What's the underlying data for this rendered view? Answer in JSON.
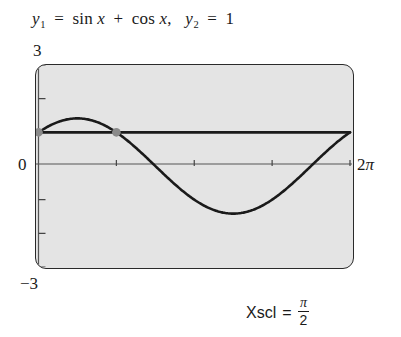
{
  "title": {
    "y1_name": "y",
    "y1_sub": "1",
    "equals": "=",
    "sin": "sin",
    "x1": "x",
    "plus": "+",
    "cos": "cos",
    "x2": "x",
    "comma": ",",
    "y2_name": "y",
    "y2_sub": "2",
    "equals2": "=",
    "y2_value": "1",
    "full_text": "y1 = sin x + cos x,  y2 = 1"
  },
  "axis_labels": {
    "y_max": "3",
    "y_min": "−3",
    "origin": "0",
    "x_max": "2π",
    "x_max_number": "2",
    "x_max_pi": "π"
  },
  "caption": {
    "label": "Xscl",
    "equals": "=",
    "numerator": "π",
    "denominator": "2",
    "full_text": "Xscl = π/2"
  },
  "colors": {
    "screen_fill": "#e4e4e4",
    "screen_border": "#2a2a2a",
    "curve": "#1a1a1a",
    "line": "#1a1a1a",
    "axis": "#555555",
    "tick": "#444444",
    "intersection_dot": "#8a8a8a",
    "text": "#1a1a1a"
  },
  "chart_data": {
    "type": "line",
    "title": "y1 = sin x + cos x,  y2 = 1",
    "xlabel": "",
    "ylabel": "",
    "xlim": [
      0,
      6.283185307179586
    ],
    "ylim": [
      -3,
      3
    ],
    "xlim_label": [
      "0",
      "2π"
    ],
    "ylim_label": [
      "−3",
      "3"
    ],
    "grid": false,
    "legend": "none",
    "xscl": 1.5707963267948966,
    "xscl_label": "π/2",
    "yscl": 1,
    "x_ticks": [
      1.5707963267948966,
      3.141592653589793,
      4.71238898038469,
      6.283185307179586
    ],
    "x_tick_labels": [
      "π/2",
      "π",
      "3π/2",
      "2π"
    ],
    "y_ticks": [
      -3,
      -2,
      -1,
      0,
      1,
      2,
      3
    ],
    "series": [
      {
        "name": "y1 = sin x + cos x",
        "expression": "sin(x) + cos(x)",
        "amplitude": 1.4142135623730951,
        "x": [
          0,
          0.3141592653589793,
          0.6283185307179586,
          0.7853981633974483,
          0.9424777960769379,
          1.2566370614359172,
          1.5707963267948966,
          1.8849555921538759,
          2.199114857512855,
          2.5132741228718345,
          2.827433388230814,
          3.141592653589793,
          3.4557519189487724,
          3.7699111843077517,
          4.084070449666731,
          3.9269908169872414,
          4.39822971502571,
          4.71238898038469,
          5.026548245743669,
          5.497787143782138,
          5.654866776461628,
          5.969026041820607,
          6.283185307179586
        ],
        "y": [
          1.0,
          1.258,
          1.397,
          1.41421,
          1.397,
          1.258,
          1.0,
          0.676,
          0.273,
          -0.169,
          -0.607,
          -1.0,
          -1.309,
          -1.507,
          -1.564,
          -1.414,
          -1.41421,
          -1.0,
          -0.273,
          0.676,
          0.916,
          1.258,
          1.0
        ],
        "max": 1.4142135623730951,
        "max_at_x": 0.7853981633974483,
        "min": -1.4142135623730951,
        "min_at_x": 3.9269908169872414,
        "style": "solid",
        "width": 2.6
      },
      {
        "name": "y2 = 1",
        "expression": "1",
        "x": [
          0,
          6.283185307179586
        ],
        "y": [
          1,
          1
        ],
        "style": "solid",
        "width": 2.6
      }
    ],
    "intersections": [
      {
        "x": 0,
        "y": 1,
        "x_label": "0"
      },
      {
        "x": 1.5707963267948966,
        "y": 1,
        "x_label": "π/2"
      }
    ]
  }
}
